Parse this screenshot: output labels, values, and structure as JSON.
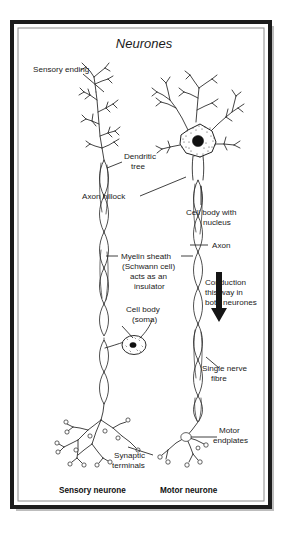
{
  "figure": {
    "title": "Neurones",
    "background_color": "#ffffff",
    "ink_color": "#222222",
    "frame": {
      "outer_border_color": "#1a1a1a",
      "inner_border_color": "#8a8a8a",
      "shadow_color": "#b9b9b9"
    },
    "labels": {
      "sensory_ending": "Sensory ending",
      "dendritic_tree_line1": "Dendritic",
      "dendritic_tree_line2": "tree",
      "axon_hillock": "Axon hillock",
      "cell_body_nucleus_line1": "Cell body with",
      "cell_body_nucleus_line2": "nucleus",
      "axon": "Axon",
      "myelin_line1": "Myelin sheath",
      "myelin_line2": "(Schwann cell)",
      "myelin_line3": "acts as an",
      "myelin_line4": "insulator",
      "cell_body_soma_line1": "Cell body",
      "cell_body_soma_line2": "(soma)",
      "conduction_line1": "Conduction",
      "conduction_line2": "this way in",
      "conduction_line3": "both neurones",
      "single_nerve_fibre_line1": "Single nerve",
      "single_nerve_fibre_line2": "fibre",
      "synaptic_terminals_line1": "Synaptic",
      "synaptic_terminals_line2": "terminals",
      "motor_endplates_line1": "Motor",
      "motor_endplates_line2": "endplates",
      "sensory_neurone_caption": "Sensory neurone",
      "motor_neurone_caption": "Motor neurone"
    },
    "diagram_parts": {
      "sensory_neurone": {
        "name": "sensory-neurone",
        "components": [
          "sensory ending",
          "dendritic tree",
          "myelinated axon",
          "cell body (soma) with nucleus",
          "synaptic terminals"
        ]
      },
      "motor_neurone": {
        "name": "motor-neurone",
        "components": [
          "dendritic tree",
          "cell body with nucleus",
          "axon hillock",
          "myelinated axon",
          "motor endplates"
        ]
      },
      "conduction_arrow": {
        "direction": "downward",
        "applies_to": "both neurones"
      }
    }
  }
}
